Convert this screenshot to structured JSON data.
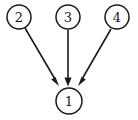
{
  "diagram": {
    "type": "directed-graph",
    "title": "",
    "background_color": "#ffffff",
    "stroke_color": "#1a1a1a",
    "node_fill_color": "#ffffff",
    "nodes": [
      {
        "id": "1",
        "label": "1",
        "cx": 69,
        "cy": 101,
        "r": 13
      },
      {
        "id": "2",
        "label": "2",
        "cx": 19,
        "cy": 17,
        "r": 12
      },
      {
        "id": "3",
        "label": "3",
        "cx": 68,
        "cy": 17,
        "r": 12
      },
      {
        "id": "4",
        "label": "4",
        "cx": 117,
        "cy": 17,
        "r": 12
      }
    ],
    "edges": [
      {
        "id": "edge-2-1",
        "from": "2",
        "to": "1",
        "x1": 25,
        "y1": 28,
        "x2": 59,
        "y2": 86,
        "arrow_angle_deg": 60
      },
      {
        "id": "edge-3-1",
        "from": "3",
        "to": "1",
        "x1": 68,
        "y1": 30,
        "x2": 68,
        "y2": 86,
        "arrow_angle_deg": 90
      },
      {
        "id": "edge-4-1",
        "from": "4",
        "to": "1",
        "x1": 111,
        "y1": 29,
        "x2": 78,
        "y2": 86,
        "arrow_angle_deg": 120
      }
    ]
  }
}
